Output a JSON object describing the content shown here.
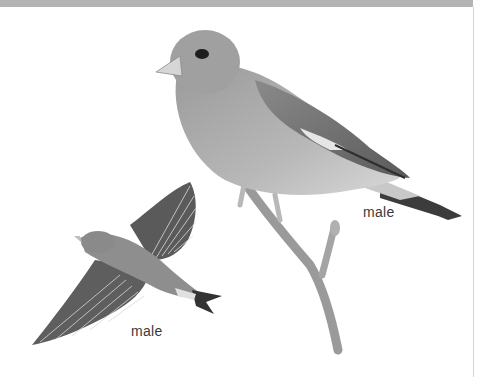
{
  "illustration": {
    "subject": "finch",
    "colors": {
      "header_band": "#b4b4b4",
      "rule": "#d4d4d4",
      "bird_body": "#a8a8a8",
      "bird_dark": "#3c3c3c",
      "branch": "#9a9a9a"
    },
    "figures": [
      {
        "pose": "perched",
        "label": "male"
      },
      {
        "pose": "flying",
        "label": "male"
      }
    ]
  }
}
